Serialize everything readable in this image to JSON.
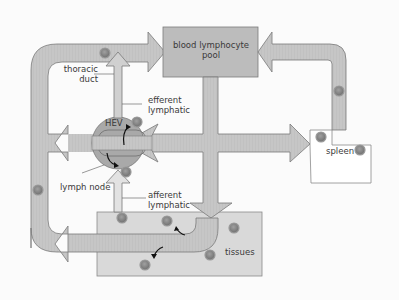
{
  "diagram": {
    "type": "lymphocyte recirculation",
    "labels": {
      "blood_pool_line1": "blood lymphocyte",
      "blood_pool_line2": "pool",
      "thoracic_line1": "thoracic",
      "thoracic_line2": "duct",
      "efferent_line1": "efferent",
      "efferent_line2": "lymphatic",
      "hev": "HEV",
      "lymph_node": "lymph node",
      "afferent_line1": "afferent",
      "afferent_line2": "lymphatic",
      "spleen": "spleen",
      "tissues": "tissues"
    },
    "nodes": [
      {
        "id": "blood-lymphocyte-pool",
        "label": "blood lymphocyte pool"
      },
      {
        "id": "lymph-node",
        "label": "lymph node"
      },
      {
        "id": "spleen",
        "label": "spleen"
      },
      {
        "id": "tissues",
        "label": "tissues"
      }
    ],
    "edges": [
      {
        "from": "lymph-node",
        "to": "blood-lymphocyte-pool",
        "via": "efferent lymphatic / thoracic duct"
      },
      {
        "from": "blood-lymphocyte-pool",
        "to": "lymph-node",
        "via": "HEV"
      },
      {
        "from": "blood-lymphocyte-pool",
        "to": "spleen"
      },
      {
        "from": "spleen",
        "to": "blood-lymphocyte-pool"
      },
      {
        "from": "blood-lymphocyte-pool",
        "to": "tissues"
      },
      {
        "from": "tissues",
        "to": "lymph-node",
        "via": "afferent lymphatic"
      }
    ],
    "colors": {
      "band": "#c4c4c4",
      "band_stroke": "#7a7a7a",
      "box": "#d8d8d8",
      "pool_box": "#bdbdbd",
      "node": "#a9a9a9",
      "cell": "#8a8a8a",
      "text": "#3a3a3a"
    }
  }
}
